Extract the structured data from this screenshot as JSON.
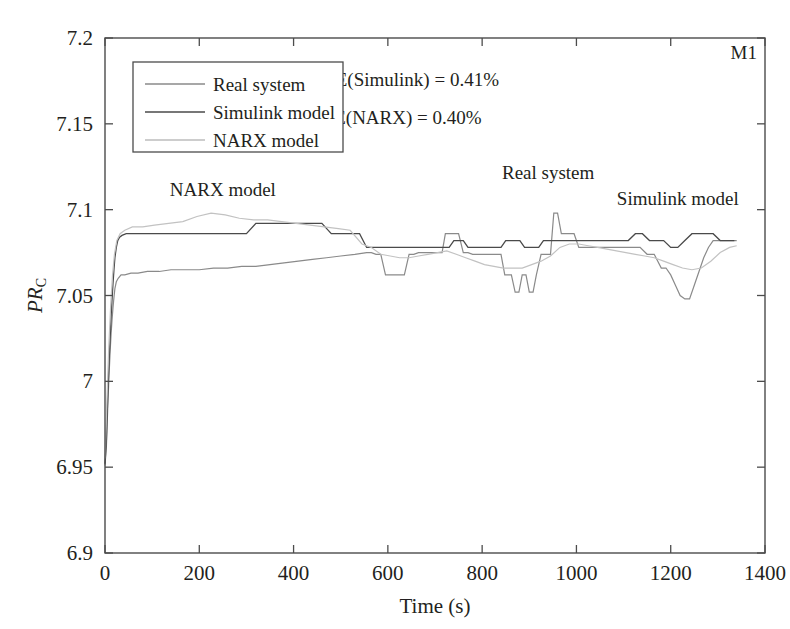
{
  "chart_data": {
    "type": "line",
    "title": "",
    "xlabel": "Time (s)",
    "ylabel": "PR_c",
    "ylabel_main": "PR",
    "ylabel_sub": "C",
    "xlim": [
      0,
      1400
    ],
    "ylim": [
      6.9,
      7.2
    ],
    "xticks": [
      0,
      200,
      400,
      600,
      800,
      1000,
      1200,
      1400
    ],
    "xtick_labels": [
      "0",
      "200",
      "400",
      "600",
      "800",
      "1000",
      "1200",
      "1400"
    ],
    "yticks": [
      6.9,
      6.95,
      7,
      7.05,
      7.1,
      7.15,
      7.2
    ],
    "ytick_labels": [
      "6.9",
      "6.95",
      "7",
      "7.05",
      "7.1",
      "7.15",
      "7.2"
    ],
    "grid": false,
    "legend_position": "upper-left",
    "corner_label": "M1",
    "annotations": [
      {
        "text": "NARX model",
        "x": 250,
        "y": 7.108
      },
      {
        "text": "Real system",
        "x": 940,
        "y": 7.118
      },
      {
        "text": "Simulink model",
        "x": 1215,
        "y": 7.103
      },
      {
        "text": "RMSE(Simulink) = 0.41%",
        "x": 620,
        "y": 7.172
      },
      {
        "text": "RMSE(NARX) = 0.40%",
        "x": 600,
        "y": 7.15
      },
      {
        "text": "M1",
        "x": 1355,
        "y": 7.188
      }
    ],
    "rmse": {
      "simulink_label": "RMSE(Simulink) = 0.41%",
      "narx_label": "RMSE(NARX) = 0.40%",
      "simulink_value": 0.41,
      "narx_value": 0.4,
      "units": "%"
    },
    "legend": [
      {
        "name": "Real system",
        "color": "#8a8a8a",
        "width": 1.3
      },
      {
        "name": "Simulink model",
        "color": "#4a4a4a",
        "width": 1.5
      },
      {
        "name": "NARX model",
        "color": "#bdbdbd",
        "width": 1.3
      }
    ],
    "series": [
      {
        "name": "Real system",
        "color": "#8a8a8a",
        "width": 1.2,
        "x": [
          0,
          3,
          5,
          7,
          9,
          11,
          13,
          15,
          17,
          19,
          21,
          24,
          28,
          34,
          42,
          55,
          70,
          90,
          115,
          140,
          170,
          200,
          230,
          260,
          290,
          320,
          350,
          380,
          410,
          440,
          470,
          500,
          530,
          555,
          565,
          575,
          585,
          595,
          605,
          615,
          625,
          635,
          645,
          655,
          665,
          675,
          685,
          695,
          705,
          715,
          722,
          730,
          740,
          750,
          760,
          770,
          780,
          790,
          800,
          810,
          820,
          830,
          840,
          848,
          855,
          862,
          870,
          878,
          885,
          893,
          900,
          908,
          915,
          925,
          935,
          945,
          952,
          960,
          968,
          975,
          985,
          995,
          1005,
          1015,
          1025,
          1035,
          1045,
          1060,
          1075,
          1090,
          1105,
          1120,
          1135,
          1150,
          1165,
          1180,
          1190,
          1200,
          1210,
          1220,
          1230,
          1240,
          1250,
          1260,
          1270,
          1280,
          1290,
          1300,
          1310,
          1320,
          1330,
          1340
        ],
        "y": [
          6.951,
          6.962,
          6.978,
          6.993,
          7.006,
          7.018,
          7.028,
          7.036,
          7.043,
          7.049,
          7.054,
          7.058,
          7.06,
          7.062,
          7.062,
          7.063,
          7.063,
          7.064,
          7.064,
          7.065,
          7.065,
          7.065,
          7.066,
          7.066,
          7.067,
          7.067,
          7.068,
          7.069,
          7.07,
          7.071,
          7.072,
          7.073,
          7.074,
          7.075,
          7.075,
          7.074,
          7.074,
          7.062,
          7.062,
          7.062,
          7.062,
          7.062,
          7.074,
          7.074,
          7.075,
          7.075,
          7.075,
          7.075,
          7.075,
          7.075,
          7.086,
          7.086,
          7.086,
          7.086,
          7.075,
          7.075,
          7.074,
          7.074,
          7.074,
          7.074,
          7.074,
          7.074,
          7.074,
          7.062,
          7.062,
          7.062,
          7.052,
          7.052,
          7.062,
          7.062,
          7.052,
          7.052,
          7.062,
          7.074,
          7.074,
          7.074,
          7.098,
          7.098,
          7.086,
          7.086,
          7.086,
          7.086,
          7.078,
          7.078,
          7.078,
          7.078,
          7.078,
          7.078,
          7.078,
          7.078,
          7.078,
          7.078,
          7.078,
          7.074,
          7.074,
          7.066,
          7.066,
          7.062,
          7.056,
          7.05,
          7.048,
          7.048,
          7.056,
          7.064,
          7.072,
          7.078,
          7.082,
          7.082,
          7.082,
          7.082,
          7.082,
          7.082
        ]
      },
      {
        "name": "Simulink model",
        "color": "#4a4a4a",
        "width": 1.3,
        "x": [
          0,
          3,
          5,
          7,
          9,
          11,
          13,
          15,
          17,
          19,
          21,
          24,
          27,
          31,
          36,
          45,
          58,
          75,
          95,
          120,
          150,
          180,
          210,
          240,
          270,
          300,
          320,
          340,
          360,
          380,
          400,
          420,
          440,
          460,
          480,
          500,
          520,
          540,
          555,
          565,
          575,
          585,
          595,
          605,
          615,
          625,
          635,
          645,
          655,
          665,
          675,
          685,
          695,
          705,
          715,
          722,
          730,
          740,
          750,
          760,
          770,
          780,
          790,
          800,
          810,
          820,
          830,
          840,
          850,
          860,
          870,
          880,
          890,
          900,
          910,
          920,
          930,
          940,
          950,
          960,
          970,
          980,
          990,
          1000,
          1010,
          1020,
          1035,
          1050,
          1065,
          1080,
          1095,
          1110,
          1125,
          1140,
          1155,
          1170,
          1185,
          1200,
          1215,
          1230,
          1245,
          1260,
          1275,
          1290,
          1305,
          1320,
          1335
        ],
        "y": [
          6.952,
          6.966,
          6.984,
          7.0,
          7.014,
          7.026,
          7.038,
          7.048,
          7.057,
          7.065,
          7.072,
          7.078,
          7.082,
          7.084,
          7.085,
          7.086,
          7.086,
          7.086,
          7.086,
          7.086,
          7.086,
          7.086,
          7.086,
          7.086,
          7.086,
          7.086,
          7.092,
          7.092,
          7.092,
          7.092,
          7.092,
          7.092,
          7.092,
          7.092,
          7.086,
          7.086,
          7.086,
          7.086,
          7.078,
          7.078,
          7.078,
          7.078,
          7.078,
          7.078,
          7.078,
          7.078,
          7.078,
          7.078,
          7.078,
          7.078,
          7.078,
          7.078,
          7.078,
          7.078,
          7.078,
          7.078,
          7.078,
          7.082,
          7.082,
          7.082,
          7.078,
          7.078,
          7.078,
          7.078,
          7.078,
          7.078,
          7.078,
          7.078,
          7.082,
          7.082,
          7.082,
          7.082,
          7.078,
          7.078,
          7.078,
          7.078,
          7.082,
          7.082,
          7.082,
          7.082,
          7.082,
          7.082,
          7.082,
          7.082,
          7.082,
          7.082,
          7.082,
          7.082,
          7.082,
          7.082,
          7.082,
          7.082,
          7.086,
          7.086,
          7.082,
          7.082,
          7.082,
          7.078,
          7.078,
          7.082,
          7.086,
          7.086,
          7.086,
          7.086,
          7.082,
          7.082,
          7.082
        ]
      },
      {
        "name": "NARX model",
        "color": "#c2c2c2",
        "width": 1.2,
        "x": [
          0,
          4,
          8,
          12,
          16,
          20,
          25,
          32,
          42,
          58,
          80,
          105,
          135,
          165,
          195,
          225,
          255,
          285,
          315,
          345,
          375,
          405,
          435,
          465,
          495,
          520,
          545,
          565,
          585,
          605,
          625,
          645,
          665,
          685,
          705,
          725,
          745,
          765,
          785,
          805,
          825,
          845,
          865,
          885,
          905,
          925,
          945,
          965,
          985,
          1005,
          1025,
          1045,
          1065,
          1085,
          1105,
          1125,
          1145,
          1165,
          1185,
          1205,
          1225,
          1245,
          1265,
          1285,
          1305,
          1325,
          1340
        ],
        "y": [
          6.955,
          6.988,
          7.02,
          7.044,
          7.062,
          7.074,
          7.082,
          7.086,
          7.088,
          7.09,
          7.09,
          7.091,
          7.092,
          7.093,
          7.096,
          7.098,
          7.097,
          7.095,
          7.094,
          7.094,
          7.093,
          7.092,
          7.091,
          7.09,
          7.089,
          7.088,
          7.08,
          7.078,
          7.074,
          7.073,
          7.072,
          7.072,
          7.073,
          7.074,
          7.075,
          7.076,
          7.074,
          7.072,
          7.07,
          7.068,
          7.067,
          7.066,
          7.066,
          7.066,
          7.068,
          7.07,
          7.073,
          7.078,
          7.08,
          7.08,
          7.079,
          7.078,
          7.077,
          7.076,
          7.075,
          7.074,
          7.073,
          7.072,
          7.07,
          7.068,
          7.066,
          7.065,
          7.066,
          7.07,
          7.075,
          7.078,
          7.079
        ]
      }
    ]
  }
}
